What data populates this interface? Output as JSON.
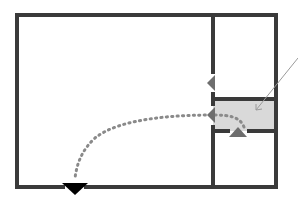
{
  "diagram": {
    "type": "floor-plan",
    "colors": {
      "wall": "#3a3a3a",
      "highlight_room": "#d9d9d9",
      "path": "#8a8a8a",
      "door_arrow": "#6e6e6e",
      "exit_arrow": "#000000",
      "pointer": "#9a9a9a"
    },
    "rooms": [
      {
        "id": "main-room",
        "label": ""
      },
      {
        "id": "upper-right-room",
        "label": ""
      },
      {
        "id": "highlighted-room",
        "label": ""
      },
      {
        "id": "lower-right-room",
        "label": ""
      }
    ],
    "markers": [
      {
        "id": "door-arrow-upper",
        "direction": "left"
      },
      {
        "id": "door-arrow-middle",
        "direction": "left"
      },
      {
        "id": "door-arrow-lower",
        "direction": "up"
      },
      {
        "id": "exit-arrow",
        "direction": "down"
      }
    ],
    "pointer": {
      "id": "callout-pointer",
      "target": "highlighted-room"
    },
    "route": {
      "from": "highlighted-room",
      "to": "exit-arrow",
      "style": "dotted-arc"
    }
  }
}
